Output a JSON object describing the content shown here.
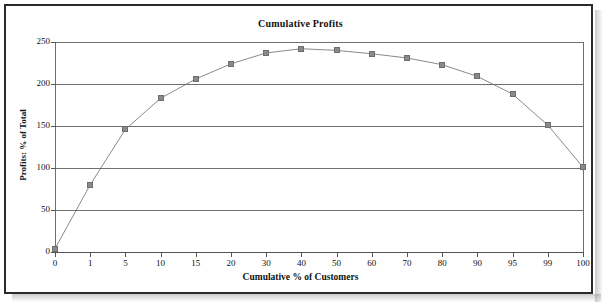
{
  "chart_data": {
    "type": "line",
    "title": "Cumulative Profits",
    "xlabel": "Cumulative % of Customers",
    "ylabel": "Profits: % of Total",
    "categories": [
      "0",
      "1",
      "5",
      "10",
      "15",
      "20",
      "30",
      "40",
      "50",
      "60",
      "70",
      "80",
      "90",
      "95",
      "99",
      "100"
    ],
    "values": [
      4,
      80,
      146,
      183,
      206,
      224,
      237,
      242,
      240,
      236,
      231,
      223,
      209,
      188,
      151,
      101
    ],
    "ylim": [
      0,
      250
    ],
    "yticks": [
      "0",
      "50",
      "100",
      "150",
      "200",
      "250"
    ],
    "ytick_values": [
      0,
      50,
      100,
      150,
      200,
      250
    ],
    "grid": "horizontal",
    "legend": "none",
    "marker": "square",
    "series_color": "#8a8a8a",
    "grid_color": "#6f6f6f",
    "frame_color": "#2b2b2b",
    "background": "#ffffff"
  }
}
